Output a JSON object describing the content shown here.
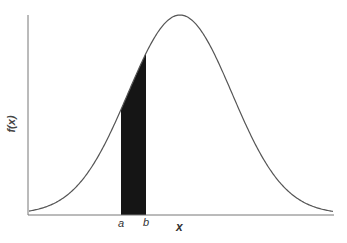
{
  "chart_data": {
    "type": "area",
    "title": "",
    "xlabel": "x",
    "ylabel": "f(x)",
    "curve": "normal",
    "shaded_region": {
      "from": "a",
      "to": "b"
    },
    "x_tick_labels": [
      "a",
      "b"
    ],
    "grid": false,
    "legend": null
  },
  "labels": {
    "y": "f(x)",
    "x": "x",
    "a": "a",
    "b": "b"
  }
}
